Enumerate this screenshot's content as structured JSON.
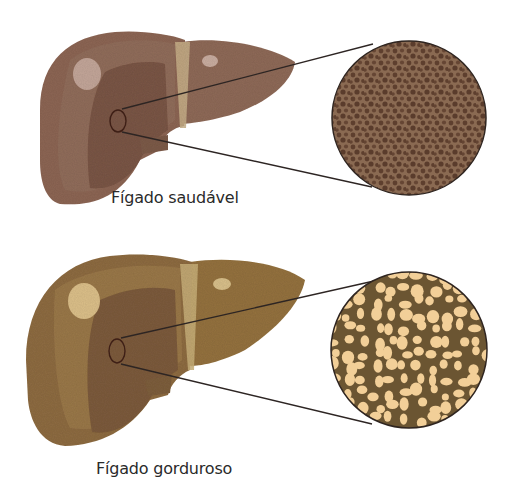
{
  "diagram": {
    "title": "",
    "panels": [
      {
        "id": "healthy",
        "label": "Fígado saudável",
        "liver_colors": {
          "base": "#8b6553",
          "outer": "#9a7462",
          "inner": "#7a5646",
          "highlight": "#c9aca0",
          "ligament": "#c8b08a"
        },
        "zoom_circle": {
          "center": [
            409,
            118
          ],
          "radius": 77,
          "tissue_color": "#7a5a44",
          "cell_color": "#5e3f2e",
          "lipid_droplets": false
        }
      },
      {
        "id": "fatty",
        "label": "Fígado gorduroso",
        "liver_colors": {
          "base": "#8e6c42",
          "outer": "#a07d4f",
          "inner": "#7d5c3c",
          "highlight": "#e2c690",
          "ligament": "#c9b07a"
        },
        "zoom_circle": {
          "center": [
            409,
            350
          ],
          "radius": 78,
          "tissue_color": "#6b5532",
          "cell_color": "#f2cf98",
          "lipid_droplets": true
        }
      }
    ]
  }
}
